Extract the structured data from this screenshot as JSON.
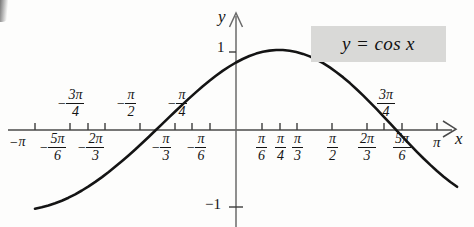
{
  "figure": {
    "equation_label": "y = cos x",
    "axis_label_x": "x",
    "axis_label_y": "y",
    "y_tick_top": "1",
    "y_tick_bottom": "−1",
    "accent_box_color": "#d9d9d7",
    "curve_color": "#141414",
    "axis_color": "#4a4a4a",
    "background_color": "#fdfdfc"
  },
  "chart_data": {
    "type": "line",
    "title": "y = cos x",
    "xlabel": "x",
    "ylabel": "y",
    "xlim": [
      -3.4033920413889427,
      3.665191429188092
    ],
    "ylim": [
      -1.35,
      1.35
    ],
    "grid": false,
    "legend": null,
    "function": "cos(x)",
    "domain_plotted": [
      -3.4033920413889427,
      3.665191429188092
    ],
    "x_tick_values": [
      -3.141592653589793,
      -2.6179938779914944,
      -2.356194490192345,
      -2.0943951023931953,
      -1.5707963267948966,
      -1.0471975511965976,
      -0.7853981633974483,
      -0.5235987755982988,
      0.5235987755982988,
      0.7853981633974483,
      1.0471975511965976,
      1.5707963267948966,
      2.0943951023931953,
      2.356194490192345,
      2.6179938779914944,
      3.141592653589793
    ],
    "x_tick_labels": [
      {
        "id": "neg-pi",
        "sign": "−",
        "whole": "π",
        "num": null,
        "den": null,
        "side": "below"
      },
      {
        "id": "neg-5pi-6",
        "sign": "−",
        "whole": null,
        "num": "5π",
        "den": "6",
        "side": "below"
      },
      {
        "id": "neg-3pi-4",
        "sign": "−",
        "whole": null,
        "num": "3π",
        "den": "4",
        "side": "above"
      },
      {
        "id": "neg-2pi-3",
        "sign": "−",
        "whole": null,
        "num": "2π",
        "den": "3",
        "side": "below"
      },
      {
        "id": "neg-pi-2",
        "sign": "−",
        "whole": null,
        "num": "π",
        "den": "2",
        "side": "above"
      },
      {
        "id": "neg-pi-3",
        "sign": "−",
        "whole": null,
        "num": "π",
        "den": "3",
        "side": "below"
      },
      {
        "id": "neg-pi-4",
        "sign": "−",
        "whole": null,
        "num": "π",
        "den": "4",
        "side": "above"
      },
      {
        "id": "neg-pi-6",
        "sign": "−",
        "whole": null,
        "num": "π",
        "den": "6",
        "side": "below"
      },
      {
        "id": "pi-6",
        "sign": "",
        "whole": null,
        "num": "π",
        "den": "6",
        "side": "below"
      },
      {
        "id": "pi-4",
        "sign": "",
        "whole": null,
        "num": "π",
        "den": "4",
        "side": "below"
      },
      {
        "id": "pi-3",
        "sign": "",
        "whole": null,
        "num": "π",
        "den": "3",
        "side": "below"
      },
      {
        "id": "pi-2",
        "sign": "",
        "whole": null,
        "num": "π",
        "den": "2",
        "side": "below"
      },
      {
        "id": "2pi-3",
        "sign": "",
        "whole": null,
        "num": "2π",
        "den": "3",
        "side": "below"
      },
      {
        "id": "3pi-4",
        "sign": "",
        "whole": null,
        "num": "3π",
        "den": "4",
        "side": "above"
      },
      {
        "id": "5pi-6",
        "sign": "",
        "whole": null,
        "num": "5π",
        "den": "6",
        "side": "below"
      },
      {
        "id": "pi",
        "sign": "",
        "whole": "π",
        "num": null,
        "den": null,
        "side": "below"
      }
    ],
    "y_tick_values": [
      1,
      -1
    ],
    "y_tick_labels": [
      "1",
      "−1"
    ],
    "key_points": [
      {
        "x": -3.141592653589793,
        "y": -1
      },
      {
        "x": -1.5707963267948966,
        "y": 0
      },
      {
        "x": 0,
        "y": 1
      },
      {
        "x": 1.5707963267948966,
        "y": 0
      },
      {
        "x": 3.141592653589793,
        "y": -1
      }
    ]
  }
}
